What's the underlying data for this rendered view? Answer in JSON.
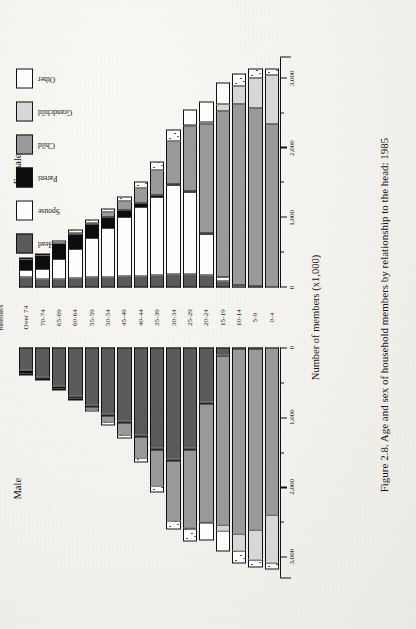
{
  "figure": {
    "caption": "Figure 2.8. Age and sex of household members by relationship to the head: 1985",
    "male_title": "Male",
    "female_title": "Female",
    "age_axis_title_line1": "Age of",
    "age_axis_title_line2": "members",
    "value_axis_title": "Number of members (x1,000)"
  },
  "legend": {
    "items": [
      {
        "label": "Head",
        "fill": "#5b5b5b",
        "key": "head"
      },
      {
        "label": "Spouse",
        "fill": "#ffffff",
        "key": "spouse"
      },
      {
        "label": "Parent",
        "fill": "#0d0d0d",
        "key": "parent"
      },
      {
        "label": "Child",
        "fill": "#9a9a9a",
        "key": "child"
      },
      {
        "label": "Grandchild",
        "fill": "#d8d8d8",
        "key": "grandchild"
      },
      {
        "label": "Other",
        "fill": "#ffffff",
        "key": "other"
      }
    ]
  },
  "chart_data": {
    "type": "bar",
    "subtype": "population-pyramid-stacked",
    "title": "Figure 2.8. Age and sex of household members by relationship to the head: 1985",
    "xlabel": "Number of members (x1,000)",
    "ylabel": "Age of members",
    "xlim": [
      0,
      3300
    ],
    "xticks_major": [
      0,
      1000,
      2000,
      3000
    ],
    "xticks_major_labels": [
      "0",
      "1,000",
      "2,000",
      "3,000"
    ],
    "xticks_minor": [
      500,
      1500,
      2500
    ],
    "grid": false,
    "legend_position": "top-right",
    "panels": [
      "Male",
      "Female"
    ],
    "categories": [
      "Over 74",
      "70-74",
      "65-69",
      "60-64",
      "55-59",
      "50-54",
      "45-49",
      "40-44",
      "35-39",
      "30-34",
      "25-29",
      "20-24",
      "15-19",
      "10-14",
      "5-9",
      "0-4"
    ],
    "stack_order": [
      "Head",
      "Spouse",
      "Parent",
      "Child",
      "Grandchild",
      "Other"
    ],
    "male": {
      "series": [
        {
          "name": "Head",
          "values": [
            330,
            420,
            560,
            700,
            830,
            960,
            1060,
            1260,
            1440,
            1600,
            1450,
            780,
            95,
            20,
            5,
            0
          ]
        },
        {
          "name": "Spouse",
          "values": [
            5,
            5,
            5,
            8,
            10,
            10,
            10,
            10,
            12,
            15,
            15,
            10,
            2,
            0,
            0,
            0
          ]
        },
        {
          "name": "Parent",
          "values": [
            40,
            25,
            18,
            12,
            10,
            8,
            6,
            5,
            4,
            3,
            2,
            1,
            0,
            0,
            0,
            0
          ]
        },
        {
          "name": "Child",
          "values": [
            0,
            0,
            0,
            10,
            30,
            90,
            175,
            300,
            520,
            870,
            1130,
            1700,
            2440,
            2650,
            2600,
            2390
          ]
        },
        {
          "name": "Grandchild",
          "values": [
            0,
            0,
            0,
            0,
            0,
            0,
            0,
            0,
            0,
            0,
            5,
            25,
            90,
            250,
            430,
            690
          ]
        },
        {
          "name": "Other",
          "values": [
            30,
            30,
            30,
            35,
            40,
            50,
            60,
            75,
            100,
            130,
            180,
            250,
            300,
            180,
            120,
            100
          ]
        }
      ],
      "totals": [
        405,
        480,
        613,
        765,
        920,
        1118,
        1311,
        1650,
        2076,
        2618,
        2782,
        2766,
        2927,
        3100,
        3155,
        3180
      ]
    },
    "female": {
      "series": [
        {
          "name": "Head",
          "values": [
            150,
            110,
            120,
            130,
            140,
            150,
            160,
            165,
            170,
            180,
            185,
            170,
            80,
            15,
            5,
            0
          ]
        },
        {
          "name": "Spouse",
          "values": [
            95,
            150,
            280,
            420,
            560,
            700,
            840,
            980,
            1120,
            1280,
            1180,
            600,
            60,
            5,
            0,
            0
          ]
        },
        {
          "name": "Parent",
          "values": [
            155,
            200,
            230,
            225,
            200,
            160,
            110,
            65,
            35,
            18,
            8,
            3,
            0,
            0,
            0,
            0
          ]
        },
        {
          "name": "Child",
          "values": [
            0,
            0,
            0,
            5,
            20,
            60,
            120,
            210,
            360,
            620,
            940,
            1570,
            2380,
            2600,
            2560,
            2340
          ]
        },
        {
          "name": "Grandchild",
          "values": [
            0,
            0,
            0,
            0,
            0,
            0,
            0,
            0,
            0,
            0,
            5,
            30,
            100,
            260,
            440,
            700
          ]
        },
        {
          "name": "Other",
          "values": [
            35,
            35,
            40,
            45,
            55,
            65,
            80,
            100,
            130,
            170,
            230,
            300,
            320,
            190,
            130,
            105
          ]
        }
      ],
      "totals": [
        435,
        495,
        670,
        825,
        975,
        1135,
        1310,
        1520,
        1815,
        2268,
        2548,
        2673,
        2940,
        3070,
        3135,
        3145
      ]
    }
  }
}
